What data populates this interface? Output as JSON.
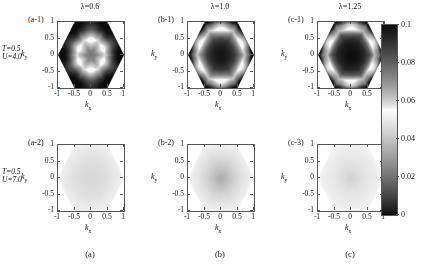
{
  "figure": {
    "width": 423,
    "height": 272,
    "background": "#ffffff"
  },
  "colors": {
    "axis": "#555555",
    "text": "#111111",
    "cmap_low": "#000000",
    "cmap_mid": "#ffffff",
    "cmap_high": "#000000",
    "outside_hexagon": "#ffffff"
  },
  "columns": [
    {
      "key": "a",
      "caption": "(a)",
      "title": "λ=0.6",
      "lambda": 0.6
    },
    {
      "key": "b",
      "caption": "(b)",
      "title": "λ=1.0",
      "lambda": 1.0
    },
    {
      "key": "c",
      "caption": "(c)",
      "title": "λ=1.25",
      "lambda": 1.25
    }
  ],
  "rows": [
    {
      "key": "top",
      "param_T": "T=0.5",
      "param_U": "U=4.0",
      "T": 0.5,
      "U": 4.0
    },
    {
      "key": "bottom",
      "param_T": "T=0.5",
      "param_U": "U=7.0",
      "T": 0.5,
      "U": 7.0
    }
  ],
  "axes": {
    "xlabel": "k",
    "xlabel_sub": "x",
    "ylabel": "k",
    "ylabel_sub": "y",
    "xticks": [
      -1,
      -0.5,
      0,
      0.5,
      1
    ],
    "xticklabels": [
      "-1",
      "-0.5",
      "0",
      "0.5",
      "1"
    ],
    "yticks": [
      -1,
      -0.5,
      0,
      0.5,
      1
    ],
    "yticklabels": [
      "-1",
      "-0.5",
      "0",
      "0.5",
      "1"
    ],
    "xlim": [
      -1,
      1
    ],
    "ylim": [
      -1,
      1
    ]
  },
  "colorbar": {
    "ticks": [
      0,
      0.02,
      0.04,
      0.06,
      0.08,
      0.1
    ],
    "ticklabels": [
      "0",
      "0.02",
      "0.04",
      "0.06",
      "0.08",
      "0.1"
    ],
    "vmin": 0,
    "vmax": 0.1,
    "orientation": "vertical",
    "position": "right"
  },
  "panels": [
    {
      "tag": "(a-1)",
      "row": "top",
      "col": "a"
    },
    {
      "tag": "(b-1)",
      "row": "top",
      "col": "b"
    },
    {
      "tag": "(c-1)",
      "row": "top",
      "col": "c"
    },
    {
      "tag": "(a-2)",
      "row": "bottom",
      "col": "a"
    },
    {
      "tag": "(b-2)",
      "row": "bottom",
      "col": "b"
    },
    {
      "tag": "(c-3)",
      "row": "bottom",
      "col": "c"
    }
  ],
  "chart_data": {
    "type": "heatmap",
    "title": "",
    "xlabel": "k_x",
    "ylabel": "k_y",
    "xlim": [
      -1,
      1
    ],
    "ylim": [
      -1,
      1
    ],
    "grid": false,
    "legend": "colorbar-right",
    "colorbar": {
      "vmin": 0,
      "vmax": 0.1,
      "ticks": [
        0,
        0.02,
        0.04,
        0.06,
        0.08,
        0.1
      ]
    },
    "domain_shape": "hexagon (first Brillouin zone of triangular lattice), flat-left/right vertices at kx=±1, top/bottom edges at ky=±1",
    "colormap_notes": "non-monotonic grayscale: value 0 -> black, ~0.055 -> white, 0.1 -> black",
    "panels": [
      {
        "tag": "(a-1)",
        "lambda": 0.6,
        "T": 0.5,
        "U": 4.0,
        "description": "Dark (high ~0.09-0.1) band hugging hexagon edges; bright rounded-square ring of value ~0.055-0.06 at radius ~0.45; moderately dark center ~0.075",
        "radial_profile_k": [
          0.0,
          0.15,
          0.3,
          0.45,
          0.6,
          0.75,
          0.9,
          1.0
        ],
        "radial_profile_value": [
          0.075,
          0.072,
          0.063,
          0.055,
          0.07,
          0.088,
          0.097,
          0.1
        ]
      },
      {
        "tag": "(b-1)",
        "lambda": 1.0,
        "T": 0.5,
        "U": 4.0,
        "description": "Large dark high-value core ~0.095 filling center out to k~0.55; bright ring ~0.055 near the hexagon edge; dark lobes just outside the ring at the zone corners",
        "radial_profile_k": [
          0.0,
          0.15,
          0.3,
          0.45,
          0.6,
          0.75,
          0.9,
          1.0
        ],
        "radial_profile_value": [
          0.098,
          0.097,
          0.094,
          0.088,
          0.074,
          0.056,
          0.072,
          0.092
        ]
      },
      {
        "tag": "(c-1)",
        "lambda": 1.25,
        "T": 0.5,
        "U": 4.0,
        "description": "Very dark high-value core ~0.10 extending to k~0.6; bright ring ~0.05 hugging the zone boundary; dark patches beyond the ring at the hexagon edge midpoints",
        "radial_profile_k": [
          0.0,
          0.15,
          0.3,
          0.45,
          0.6,
          0.75,
          0.9,
          1.0
        ],
        "radial_profile_value": [
          0.1,
          0.099,
          0.097,
          0.093,
          0.082,
          0.058,
          0.068,
          0.09
        ]
      },
      {
        "tag": "(a-2)",
        "lambda": 0.6,
        "T": 0.5,
        "U": 7.0,
        "description": "Nearly featureless light-gray hexagon, values ~0.040-0.050, very slightly darker toward the centre",
        "radial_profile_k": [
          0.0,
          0.15,
          0.3,
          0.45,
          0.6,
          0.75,
          0.9,
          1.0
        ],
        "radial_profile_value": [
          0.0455,
          0.0455,
          0.046,
          0.0468,
          0.0478,
          0.049,
          0.0505,
          0.0515
        ]
      },
      {
        "tag": "(b-2)",
        "lambda": 1.0,
        "T": 0.5,
        "U": 7.0,
        "description": "Smooth gradient: dark spot ~0.035 at the zone centre fading outwards to light ~0.052 at the zone boundary",
        "radial_profile_k": [
          0.0,
          0.15,
          0.3,
          0.45,
          0.6,
          0.75,
          0.9,
          1.0
        ],
        "radial_profile_value": [
          0.034,
          0.037,
          0.0405,
          0.0435,
          0.0462,
          0.0485,
          0.0505,
          0.052
        ]
      },
      {
        "tag": "(c-3)",
        "lambda": 1.25,
        "T": 0.5,
        "U": 7.0,
        "description": "Light gray hexagon with a faint small dark speckle at the centre, ~0.044 core rising to ~0.053 at the edges",
        "radial_profile_k": [
          0.0,
          0.15,
          0.3,
          0.45,
          0.6,
          0.75,
          0.9,
          1.0
        ],
        "radial_profile_value": [
          0.043,
          0.0452,
          0.047,
          0.0482,
          0.0492,
          0.0502,
          0.0512,
          0.0525
        ]
      }
    ]
  }
}
